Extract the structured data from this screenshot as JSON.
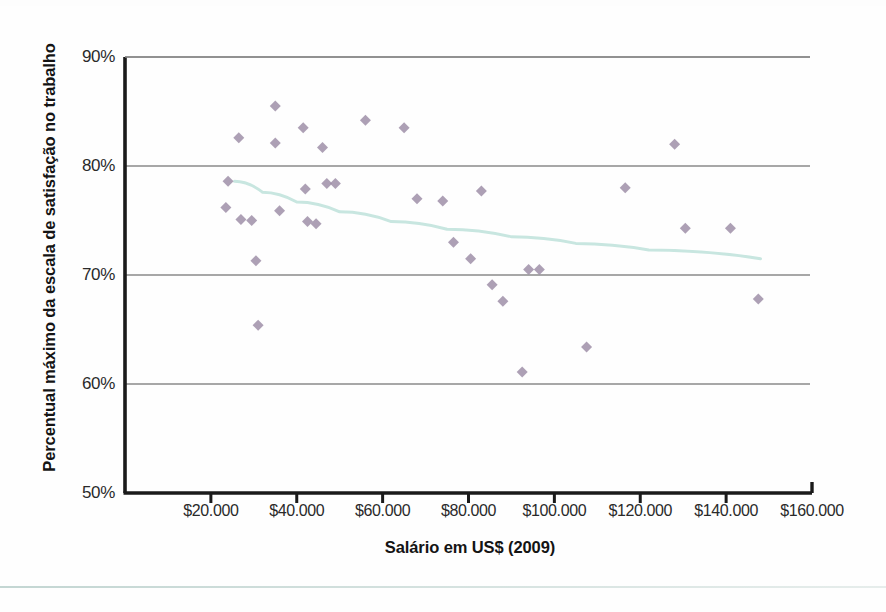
{
  "chart_data": {
    "type": "scatter",
    "title": "",
    "xlabel": "Salário em US$ (2009)",
    "ylabel": "Percentual máximo da escala de satisfação no trabalho",
    "xlim": [
      0,
      160000
    ],
    "ylim": [
      50,
      90
    ],
    "grid": "horizontal",
    "legend": "none",
    "x_tick_labels": [
      "$20.000",
      "$40.000",
      "$60.000",
      "$80.000",
      "$100.000",
      "$120.000",
      "$140.000",
      "$160.000"
    ],
    "x_tick_values": [
      20000,
      40000,
      60000,
      80000,
      100000,
      120000,
      140000,
      160000
    ],
    "y_tick_labels": [
      "90%",
      "80%",
      "70%",
      "60%",
      "50%"
    ],
    "y_tick_values": [
      90,
      80,
      70,
      60,
      50
    ],
    "marker": {
      "shape": "diamond",
      "color": "#9f8fa8",
      "size_px": 11,
      "opacity": 0.85
    },
    "trendline": {
      "label": "",
      "type": "logarithmic",
      "color": "#c8e6e0",
      "width_px": 3,
      "points": [
        {
          "x": 25500,
          "y": 78.6
        },
        {
          "x": 32000,
          "y": 77.6
        },
        {
          "x": 40000,
          "y": 76.7
        },
        {
          "x": 50000,
          "y": 75.8
        },
        {
          "x": 62000,
          "y": 74.9
        },
        {
          "x": 75000,
          "y": 74.2
        },
        {
          "x": 90000,
          "y": 73.5
        },
        {
          "x": 105000,
          "y": 72.9
        },
        {
          "x": 122000,
          "y": 72.3
        },
        {
          "x": 148000,
          "y": 71.5
        }
      ]
    },
    "points": [
      {
        "x": 24000,
        "y": 78.6
      },
      {
        "x": 23500,
        "y": 76.2
      },
      {
        "x": 26500,
        "y": 82.6
      },
      {
        "x": 27000,
        "y": 75.1
      },
      {
        "x": 29500,
        "y": 75.0
      },
      {
        "x": 30500,
        "y": 71.3
      },
      {
        "x": 31000,
        "y": 65.4
      },
      {
        "x": 35000,
        "y": 85.5
      },
      {
        "x": 35000,
        "y": 82.1
      },
      {
        "x": 36000,
        "y": 75.9
      },
      {
        "x": 41500,
        "y": 83.5
      },
      {
        "x": 42000,
        "y": 77.9
      },
      {
        "x": 42500,
        "y": 74.9
      },
      {
        "x": 44500,
        "y": 74.7
      },
      {
        "x": 46000,
        "y": 81.7
      },
      {
        "x": 47000,
        "y": 78.4
      },
      {
        "x": 49000,
        "y": 78.4
      },
      {
        "x": 56000,
        "y": 84.2
      },
      {
        "x": 65000,
        "y": 83.5
      },
      {
        "x": 68000,
        "y": 77.0
      },
      {
        "x": 74000,
        "y": 76.8
      },
      {
        "x": 76500,
        "y": 73.0
      },
      {
        "x": 80500,
        "y": 71.5
      },
      {
        "x": 83000,
        "y": 77.7
      },
      {
        "x": 85500,
        "y": 69.1
      },
      {
        "x": 88000,
        "y": 67.6
      },
      {
        "x": 92500,
        "y": 61.1
      },
      {
        "x": 94000,
        "y": 70.5
      },
      {
        "x": 96500,
        "y": 70.5
      },
      {
        "x": 107500,
        "y": 63.4
      },
      {
        "x": 116500,
        "y": 78.0
      },
      {
        "x": 128000,
        "y": 82.0
      },
      {
        "x": 130500,
        "y": 74.3
      },
      {
        "x": 141000,
        "y": 74.3
      },
      {
        "x": 147500,
        "y": 67.8
      }
    ]
  },
  "axis_style": {
    "axis_color": "#1a1a1a",
    "gridline_color": "#8a8a8a",
    "background": "#ffffff"
  }
}
